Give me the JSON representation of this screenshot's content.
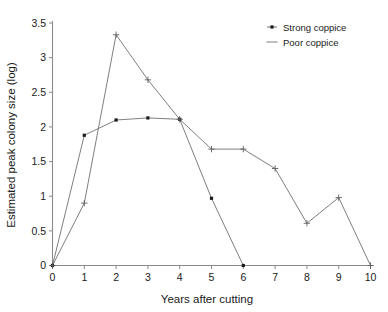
{
  "chart_data": {
    "type": "line",
    "title": "",
    "xlabel": "Years after cutting",
    "ylabel": "Estimated peak colony size (log)",
    "xlim": [
      0,
      10
    ],
    "ylim": [
      0,
      3.5
    ],
    "grid": false,
    "legend_position": "top-right",
    "xticks": [
      "0",
      "1",
      "2",
      "3",
      "4",
      "5",
      "6",
      "7",
      "8",
      "9",
      "10"
    ],
    "xtick_values": [
      0,
      1,
      2,
      3,
      4,
      5,
      6,
      7,
      8,
      9,
      10
    ],
    "yticks": [
      "0",
      "0.5",
      "1",
      "1.5",
      "2",
      "2.5",
      "3",
      "3.5"
    ],
    "ytick_values": [
      0,
      0.5,
      1,
      1.5,
      2,
      2.5,
      3,
      3.5
    ],
    "series": [
      {
        "name": "Strong coppice",
        "marker": "dot",
        "x": [
          0,
          1,
          2,
          3,
          4,
          5,
          6
        ],
        "values": [
          0,
          1.88,
          2.1,
          2.13,
          2.11,
          0.97,
          0
        ]
      },
      {
        "name": "Poor coppice",
        "marker": "plus",
        "x": [
          0,
          1,
          2,
          3,
          4,
          5,
          6,
          7,
          8,
          9,
          10
        ],
        "values": [
          0,
          0.9,
          3.33,
          2.68,
          2.11,
          1.68,
          1.68,
          1.4,
          0.61,
          0.98,
          0
        ]
      }
    ]
  },
  "legend": {
    "entries": [
      {
        "label": "Strong coppice",
        "marker": "dot"
      },
      {
        "label": "Poor coppice",
        "marker": "line"
      }
    ]
  },
  "colors": {
    "axis": "#8a8a8a",
    "line": "#6f6f6f",
    "marker": "#1a1a1a",
    "text": "#1a1a1a",
    "background": "#ffffff"
  }
}
